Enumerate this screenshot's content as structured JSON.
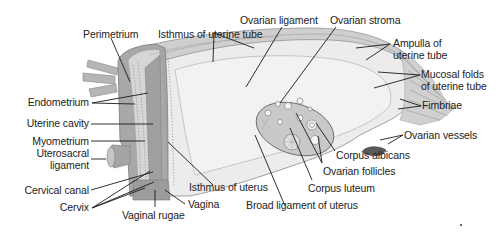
{
  "diagram": {
    "colors": {
      "background": "#ffffff",
      "tissue_dark": "#9a9a9a",
      "tissue_mid": "#bdbdbd",
      "tissue_light": "#dedede",
      "tissue_pale": "#ececec",
      "outline": "#6e6e6e",
      "leader_line": "#1a1a1a",
      "text": "#222222"
    },
    "labels": {
      "perimetrium": "Perimetrium",
      "isthmus_uterine_tube": "Isthmus of uterine tube",
      "ovarian_ligament": "Ovarian ligament",
      "ovarian_stroma": "Ovarian stroma",
      "ampulla_line1": "Ampulla of",
      "ampulla_line2": "uterine tube",
      "mucosal_line1": "Mucosal folds",
      "mucosal_line2": "of uterine tube",
      "fimbriae": "Fimbriae",
      "ovarian_vessels": "Ovarian vessels",
      "corpus_albicans": "Corpus albicans",
      "ovarian_follicles": "Ovarian follicles",
      "corpus_luteum": "Corpus luteum",
      "broad_ligament": "Broad ligament of uterus",
      "isthmus_uterus": "Isthmus of uterus",
      "vagina": "Vagina",
      "vaginal_rugae": "Vaginal rugae",
      "cervix": "Cervix",
      "cervical_canal": "Cervical canal",
      "uterosacral_line1": "Uterosacral",
      "uterosacral_line2": "ligament",
      "myometrium": "Myometrium",
      "uterine_cavity": "Uterine cavity",
      "endometrium": "Endometrium"
    }
  }
}
